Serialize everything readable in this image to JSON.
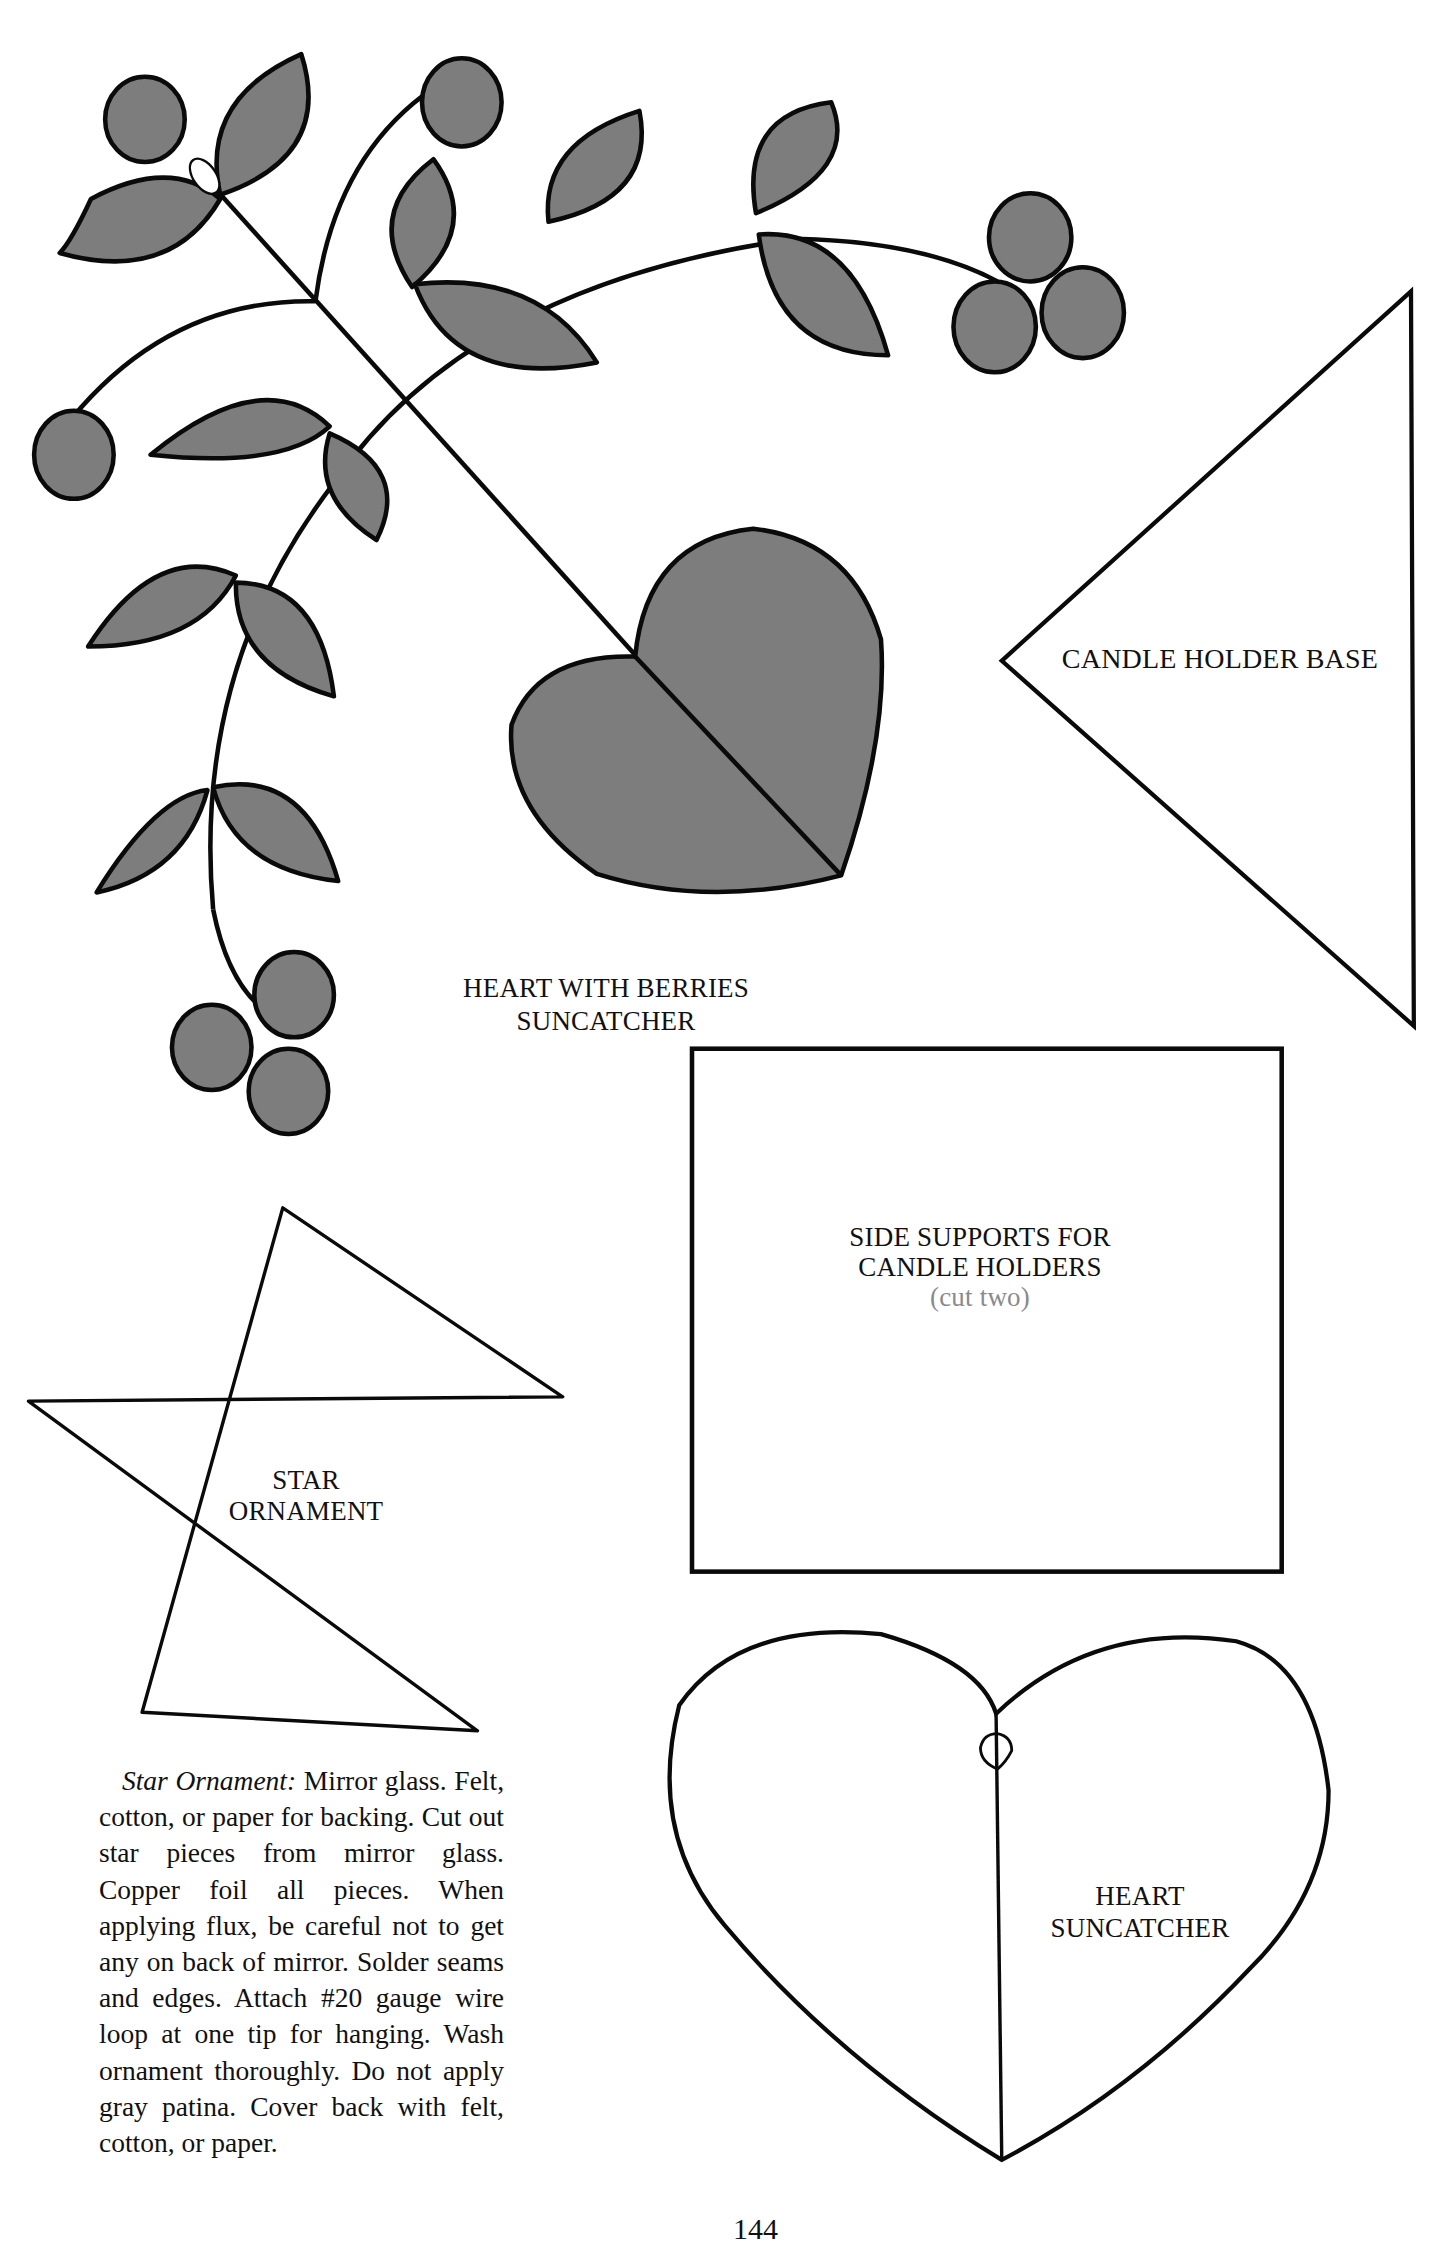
{
  "page": {
    "number": "144",
    "colors": {
      "fill": "#7d7d7d",
      "stroke": "#0a0a0a",
      "paper": "#ffffff",
      "muted_text": "#8a8a8a"
    }
  },
  "patterns": {
    "heart_with_berries": {
      "line1": "HEART WITH BERRIES",
      "line2": "SUNCATCHER"
    },
    "candle_holder_base": {
      "label": "CANDLE HOLDER BASE"
    },
    "side_supports": {
      "line1": "SIDE SUPPORTS FOR",
      "line2": "CANDLE HOLDERS",
      "note": "(cut two)"
    },
    "star_ornament": {
      "line1": "STAR",
      "line2": "ORNAMENT"
    },
    "heart_suncatcher": {
      "line1": "HEART",
      "line2": "SUNCATCHER"
    }
  },
  "instructions": {
    "title": "Star Ornament:",
    "text": "Mirror glass. Felt, cotton, or paper for back­ing. Cut out star pieces from mirror glass. Copper foil all pieces. When applying flux, be careful not to get any on back of mirror. Solder seams and edges. Attach #20 gauge wire loop at one tip for hanging. Wash orna­ment thoroughly. Do not apply gray patina. Cover back with felt, cotton, or paper."
  }
}
